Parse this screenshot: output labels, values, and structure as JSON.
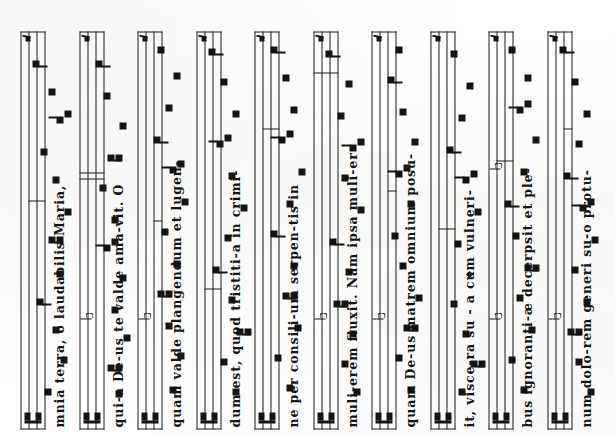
{
  "document": {
    "kind": "chant-manuscript-scan",
    "orientation_degrees": -90,
    "notation": "square-neume",
    "staff_lines": 4,
    "clef": "C-clef",
    "ink_color": "#141414",
    "page_color": "#fdfdfc",
    "system_count": 10
  },
  "systems": [
    {
      "index": 1,
      "lyrics": "mnia terra, o laudabilis Maria,",
      "has_clef": true,
      "has_custos": true,
      "flats": 0,
      "neumes": [
        {
          "x": 34,
          "pitch": 14,
          "shape": "punctum"
        },
        {
          "x": 66,
          "pitch": 10,
          "shape": "punctum"
        },
        {
          "x": 96,
          "pitch": 12,
          "shape": "punctum"
        },
        {
          "x": 124,
          "pitch": 16,
          "shape": "virga"
        },
        {
          "x": 152,
          "pitch": 11,
          "shape": "punctum"
        },
        {
          "x": 186,
          "pitch": 13,
          "shape": "podatus"
        },
        {
          "x": 214,
          "pitch": 9,
          "shape": "punctum"
        },
        {
          "x": 246,
          "pitch": 12,
          "shape": "punctum"
        },
        {
          "x": 274,
          "pitch": 15,
          "shape": "punctum"
        },
        {
          "x": 306,
          "pitch": 11,
          "shape": "clivis"
        },
        {
          "x": 334,
          "pitch": 13,
          "shape": "punctum"
        },
        {
          "x": 362,
          "pitch": 17,
          "shape": "virga"
        }
      ],
      "dividers": [
        {
          "x": 228,
          "type": "half"
        }
      ]
    },
    {
      "index": 2,
      "lyrics": "qui-a De-us te valde ama-vit. O",
      "has_clef": true,
      "has_custos": true,
      "flats": 1,
      "neumes": [
        {
          "x": 32,
          "pitch": 11,
          "shape": "punctum"
        },
        {
          "x": 58,
          "pitch": 13,
          "shape": "podatus"
        },
        {
          "x": 88,
          "pitch": 9,
          "shape": "punctum"
        },
        {
          "x": 116,
          "pitch": 12,
          "shape": "punctum"
        },
        {
          "x": 148,
          "pitch": 10,
          "shape": "punctum"
        },
        {
          "x": 178,
          "pitch": 14,
          "shape": "clivis"
        },
        {
          "x": 206,
          "pitch": 12,
          "shape": "punctum"
        },
        {
          "x": 238,
          "pitch": 15,
          "shape": "punctum"
        },
        {
          "x": 268,
          "pitch": 13,
          "shape": "podatus"
        },
        {
          "x": 300,
          "pitch": 10,
          "shape": "punctum"
        },
        {
          "x": 330,
          "pitch": 14,
          "shape": "punctum"
        },
        {
          "x": 362,
          "pitch": 16,
          "shape": "virga"
        }
      ],
      "dividers": [
        {
          "x": 250,
          "type": "double-a"
        },
        {
          "x": 256,
          "type": "double-b"
        }
      ]
    },
    {
      "index": 3,
      "lyrics": "quam valde plangendum et lugen-",
      "has_clef": true,
      "has_custos": true,
      "flats": 1,
      "neumes": [
        {
          "x": 36,
          "pitch": 12,
          "shape": "punctum"
        },
        {
          "x": 70,
          "pitch": 10,
          "shape": "punctum"
        },
        {
          "x": 100,
          "pitch": 13,
          "shape": "punctum"
        },
        {
          "x": 132,
          "pitch": 15,
          "shape": "podatus"
        },
        {
          "x": 162,
          "pitch": 11,
          "shape": "punctum"
        },
        {
          "x": 194,
          "pitch": 14,
          "shape": "punctum"
        },
        {
          "x": 224,
          "pitch": 9,
          "shape": "punctum"
        },
        {
          "x": 256,
          "pitch": 12,
          "shape": "clivis"
        },
        {
          "x": 286,
          "pitch": 16,
          "shape": "virga"
        },
        {
          "x": 318,
          "pitch": 13,
          "shape": "punctum"
        },
        {
          "x": 350,
          "pitch": 11,
          "shape": "punctum"
        },
        {
          "x": 376,
          "pitch": 15,
          "shape": "punctum"
        }
      ],
      "dividers": [
        {
          "x": 208,
          "type": "quarter"
        }
      ]
    },
    {
      "index": 4,
      "lyrics": "dum est, quod tristiti-a in crimi-",
      "has_clef": true,
      "has_custos": true,
      "flats": 0,
      "neumes": [
        {
          "x": 34,
          "pitch": 11,
          "shape": "punctum"
        },
        {
          "x": 64,
          "pitch": 14,
          "shape": "punctum"
        },
        {
          "x": 94,
          "pitch": 10,
          "shape": "podatus"
        },
        {
          "x": 126,
          "pitch": 12,
          "shape": "punctum"
        },
        {
          "x": 156,
          "pitch": 16,
          "shape": "virga"
        },
        {
          "x": 188,
          "pitch": 13,
          "shape": "punctum"
        },
        {
          "x": 218,
          "pitch": 9,
          "shape": "punctum"
        },
        {
          "x": 250,
          "pitch": 12,
          "shape": "punctum"
        },
        {
          "x": 282,
          "pitch": 15,
          "shape": "clivis"
        },
        {
          "x": 312,
          "pitch": 11,
          "shape": "punctum"
        },
        {
          "x": 344,
          "pitch": 14,
          "shape": "punctum"
        },
        {
          "x": 374,
          "pitch": 17,
          "shape": "virga"
        }
      ],
      "dividers": [
        {
          "x": 140,
          "type": "half"
        }
      ]
    },
    {
      "index": 5,
      "lyrics": "ne per consili-um serpen-tis in",
      "has_clef": true,
      "has_custos": true,
      "flats": 0,
      "neumes": [
        {
          "x": 38,
          "pitch": 12,
          "shape": "punctum"
        },
        {
          "x": 68,
          "pitch": 15,
          "shape": "punctum"
        },
        {
          "x": 98,
          "pitch": 10,
          "shape": "punctum"
        },
        {
          "x": 130,
          "pitch": 13,
          "shape": "podatus"
        },
        {
          "x": 160,
          "pitch": 11,
          "shape": "punctum"
        },
        {
          "x": 192,
          "pitch": 16,
          "shape": "virga"
        },
        {
          "x": 222,
          "pitch": 12,
          "shape": "punctum"
        },
        {
          "x": 254,
          "pitch": 9,
          "shape": "punctum"
        },
        {
          "x": 286,
          "pitch": 14,
          "shape": "clivis"
        },
        {
          "x": 316,
          "pitch": 11,
          "shape": "punctum"
        },
        {
          "x": 348,
          "pitch": 13,
          "shape": "punctum"
        },
        {
          "x": 376,
          "pitch": 16,
          "shape": "virga"
        }
      ],
      "dividers": [
        {
          "x": 300,
          "type": "half"
        }
      ]
    },
    {
      "index": 6,
      "lyrics": "muli-erem fluxit. Nam ipsa muli-er",
      "has_clef": true,
      "has_custos": true,
      "flats": 1,
      "neumes": [
        {
          "x": 34,
          "pitch": 10,
          "shape": "punctum"
        },
        {
          "x": 62,
          "pitch": 13,
          "shape": "punctum"
        },
        {
          "x": 92,
          "pitch": 11,
          "shape": "punctum"
        },
        {
          "x": 122,
          "pitch": 15,
          "shape": "podatus"
        },
        {
          "x": 154,
          "pitch": 12,
          "shape": "punctum"
        },
        {
          "x": 184,
          "pitch": 16,
          "shape": "virga"
        },
        {
          "x": 216,
          "pitch": 9,
          "shape": "punctum"
        },
        {
          "x": 248,
          "pitch": 13,
          "shape": "punctum"
        },
        {
          "x": 278,
          "pitch": 11,
          "shape": "clivis"
        },
        {
          "x": 310,
          "pitch": 14,
          "shape": "punctum"
        },
        {
          "x": 342,
          "pitch": 12,
          "shape": "punctum"
        },
        {
          "x": 372,
          "pitch": 17,
          "shape": "virga"
        }
      ],
      "dividers": [
        {
          "x": 356,
          "type": "full"
        }
      ]
    },
    {
      "index": 7,
      "lyrics": "quam De-us matrem omnium posu-",
      "has_clef": true,
      "has_custos": true,
      "flats": 1,
      "neumes": [
        {
          "x": 36,
          "pitch": 11,
          "shape": "punctum"
        },
        {
          "x": 68,
          "pitch": 14,
          "shape": "punctum"
        },
        {
          "x": 98,
          "pitch": 12,
          "shape": "podatus"
        },
        {
          "x": 128,
          "pitch": 9,
          "shape": "punctum"
        },
        {
          "x": 160,
          "pitch": 13,
          "shape": "punctum"
        },
        {
          "x": 190,
          "pitch": 15,
          "shape": "punctum"
        },
        {
          "x": 222,
          "pitch": 11,
          "shape": "punctum"
        },
        {
          "x": 252,
          "pitch": 14,
          "shape": "clivis"
        },
        {
          "x": 284,
          "pitch": 10,
          "shape": "punctum"
        },
        {
          "x": 314,
          "pitch": 13,
          "shape": "punctum"
        },
        {
          "x": 346,
          "pitch": 16,
          "shape": "virga"
        },
        {
          "x": 376,
          "pitch": 14,
          "shape": "punctum"
        }
      ],
      "dividers": [
        {
          "x": 238,
          "type": "quarter"
        }
      ]
    },
    {
      "index": 8,
      "lyrics": "it, visce-ra su - a cum vulneri-",
      "has_clef": true,
      "has_custos": true,
      "flats": 0,
      "neumes": [
        {
          "x": 34,
          "pitch": 13,
          "shape": "punctum"
        },
        {
          "x": 62,
          "pitch": 10,
          "shape": "podatus"
        },
        {
          "x": 92,
          "pitch": 12,
          "shape": "punctum"
        },
        {
          "x": 122,
          "pitch": 15,
          "shape": "punctum"
        },
        {
          "x": 152,
          "pitch": 11,
          "shape": "diamond"
        },
        {
          "x": 182,
          "pitch": 14,
          "shape": "punctum"
        },
        {
          "x": 214,
          "pitch": 9,
          "shape": "punctum"
        },
        {
          "x": 246,
          "pitch": 12,
          "shape": "clivis"
        },
        {
          "x": 276,
          "pitch": 16,
          "shape": "virga"
        },
        {
          "x": 308,
          "pitch": 13,
          "shape": "punctum"
        },
        {
          "x": 340,
          "pitch": 11,
          "shape": "punctum"
        },
        {
          "x": 372,
          "pitch": 15,
          "shape": "punctum"
        }
      ],
      "dividers": [
        {
          "x": 200,
          "type": "half"
        }
      ]
    },
    {
      "index": 9,
      "lyrics": "bus ignoranti-æ decerpsit et ple-",
      "has_clef": true,
      "has_custos": true,
      "flats": 2,
      "neumes": [
        {
          "x": 36,
          "pitch": 12,
          "shape": "punctum"
        },
        {
          "x": 66,
          "pitch": 15,
          "shape": "punctum"
        },
        {
          "x": 96,
          "pitch": 10,
          "shape": "punctum"
        },
        {
          "x": 128,
          "pitch": 13,
          "shape": "punctum"
        },
        {
          "x": 158,
          "pitch": 11,
          "shape": "podatus"
        },
        {
          "x": 190,
          "pitch": 14,
          "shape": "punctum"
        },
        {
          "x": 222,
          "pitch": 16,
          "shape": "virga"
        },
        {
          "x": 254,
          "pitch": 12,
          "shape": "punctum"
        },
        {
          "x": 286,
          "pitch": 9,
          "shape": "punctum"
        },
        {
          "x": 316,
          "pitch": 13,
          "shape": "clivis"
        },
        {
          "x": 348,
          "pitch": 11,
          "shape": "punctum"
        },
        {
          "x": 376,
          "pitch": 15,
          "shape": "punctum"
        }
      ],
      "dividers": [
        {
          "x": 268,
          "type": "half"
        }
      ]
    },
    {
      "index": 10,
      "lyrics": "num dolo-rem generi su-o protu-",
      "has_clef": true,
      "has_custos": true,
      "flats": 1,
      "neumes": [
        {
          "x": 34,
          "pitch": 10,
          "shape": "punctum"
        },
        {
          "x": 64,
          "pitch": 13,
          "shape": "punctum"
        },
        {
          "x": 94,
          "pitch": 15,
          "shape": "podatus"
        },
        {
          "x": 124,
          "pitch": 11,
          "shape": "punctum"
        },
        {
          "x": 156,
          "pitch": 14,
          "shape": "punctum"
        },
        {
          "x": 186,
          "pitch": 9,
          "shape": "punctum"
        },
        {
          "x": 218,
          "pitch": 12,
          "shape": "clivis"
        },
        {
          "x": 250,
          "pitch": 16,
          "shape": "virga"
        },
        {
          "x": 282,
          "pitch": 13,
          "shape": "punctum"
        },
        {
          "x": 312,
          "pitch": 11,
          "shape": "punctum"
        },
        {
          "x": 344,
          "pitch": 14,
          "shape": "punctum"
        },
        {
          "x": 376,
          "pitch": 17,
          "shape": "virga"
        }
      ],
      "dividers": [
        {
          "x": 300,
          "type": "quarter"
        }
      ]
    }
  ],
  "full_text": "mnia terra, o laudabilis Maria, qui-a De-us te valde ama-vit. O quam valde plangendum et lugen-dum est, quod tristiti-a in crimi-ne per consili-um serpen-tis in muli-erem fluxit. Nam ipsa muli-er quam De-us matrem omnium posu-it, visce-ra su - a cum vulneri-bus ignoranti-æ decerpsit et ple-num dolo-rem generi su-o protu-"
}
